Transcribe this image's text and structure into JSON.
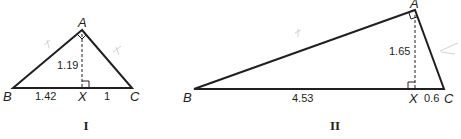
{
  "figures": [
    {
      "caption": "I",
      "vertices": {
        "A": "A",
        "B": "B",
        "C": "C",
        "X": "X"
      },
      "altitude_label": "1.19",
      "segment_BX": "1.42",
      "segment_XC": "1",
      "right_angles": [
        "A",
        "X"
      ]
    },
    {
      "caption": "II",
      "vertices": {
        "A": "A",
        "B": "B",
        "C": "C",
        "X": "X"
      },
      "altitude_label": "1.65",
      "segment_BX": "4.53",
      "segment_XC": "0.6",
      "right_angles": [
        "A",
        "X"
      ]
    }
  ],
  "colors": {
    "ink": "#231f20",
    "pencil": "#c8c8c8"
  }
}
